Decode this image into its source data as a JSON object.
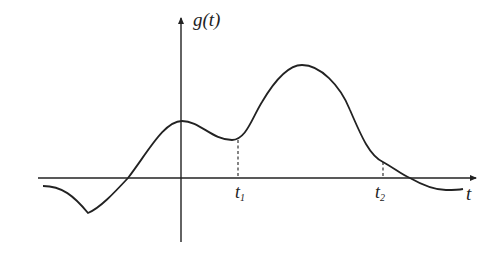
{
  "diagram": {
    "title": "",
    "type": "function-plot",
    "y_axis_label": "g(t)",
    "x_axis_label": "t",
    "markers": [
      {
        "name": "t",
        "sub": "1",
        "label": "t1"
      },
      {
        "name": "t",
        "sub": "2",
        "label": "t2"
      }
    ],
    "colors": {
      "stroke": "#222222",
      "background": "#ffffff"
    }
  }
}
